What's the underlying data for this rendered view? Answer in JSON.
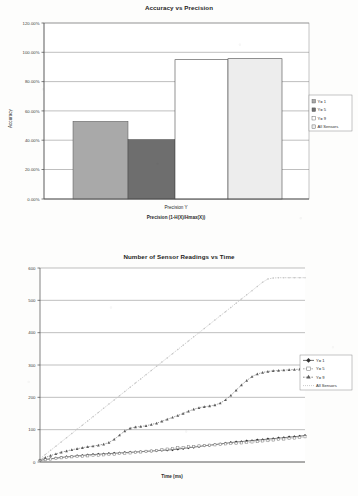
{
  "page": {
    "background": "#fdfdfc",
    "ink": "#2b2b2b"
  },
  "chart_data": [
    {
      "id": "accuracy-vs-precision",
      "type": "bar",
      "title": "Accuracy vs Precision",
      "xlabel": "Precision (1-H(X)/Hmax(X))",
      "x_tick_label": "Precision Y",
      "ylabel": "Accuracy",
      "ylim": [
        0,
        1.2
      ],
      "ytick_labels": [
        "0.00%",
        "20.00%",
        "40.00%",
        "60.00%",
        "80.00%",
        "100.00%",
        "120.00%"
      ],
      "ytick_values": [
        0,
        0.2,
        0.4,
        0.6,
        0.8,
        1.0,
        1.2
      ],
      "grid": true,
      "legend_position": "right",
      "categories": [
        "Y= 1",
        "Y= 5",
        "Y= 9",
        "All Sensors"
      ],
      "values": [
        0.53,
        0.405,
        0.95,
        0.957
      ],
      "value_labels": [
        "53.00%",
        "40.50%",
        "95.00%",
        "95.70%"
      ],
      "bar_colors": [
        "#a9a9a9",
        "#6e6e6e",
        "#ffffff",
        "#ededed"
      ],
      "series": [
        {
          "name": "Y= 1",
          "value": 0.53,
          "color": "#a9a9a9"
        },
        {
          "name": "Y= 5",
          "value": 0.405,
          "color": "#6e6e6e"
        },
        {
          "name": "Y= 9",
          "value": 0.95,
          "color": "#ffffff"
        },
        {
          "name": "All Sensors",
          "value": 0.957,
          "color": "#ededed"
        }
      ]
    },
    {
      "id": "sensor-readings-vs-time",
      "type": "line",
      "title": "Number of Sensor Readings vs Time",
      "xlabel": "Time (ms)",
      "ylabel": "",
      "ylim": [
        0,
        600
      ],
      "ytick_labels": [
        "0",
        "100",
        "200",
        "300",
        "400",
        "500",
        "600"
      ],
      "ytick_values": [
        0,
        100,
        200,
        300,
        400,
        500,
        600
      ],
      "grid": true,
      "legend_position": "right",
      "x": [
        0,
        2,
        4,
        6,
        8,
        10,
        12,
        14,
        16,
        18,
        20,
        22,
        24,
        26,
        28,
        30,
        32,
        34,
        36,
        38,
        40,
        42,
        44,
        46,
        48,
        50,
        52,
        54,
        56,
        58,
        60,
        62,
        64,
        66,
        68,
        70,
        72,
        74,
        76,
        78,
        80,
        82,
        84,
        86,
        88,
        90,
        92,
        94,
        96,
        98,
        100
      ],
      "series": [
        {
          "name": "Y= 1",
          "color": "#303030",
          "marker": "diamond",
          "values": [
            5,
            8,
            10,
            12,
            14,
            16,
            17,
            19,
            20,
            22,
            23,
            24,
            25,
            26,
            27,
            28,
            29,
            30,
            31,
            32,
            33,
            34,
            35,
            36,
            37,
            38,
            40,
            42,
            44,
            46,
            48,
            50,
            52,
            54,
            56,
            58,
            60,
            62,
            63,
            65,
            66,
            68,
            69,
            71,
            72,
            74,
            75,
            77,
            78,
            80,
            82
          ]
        },
        {
          "name": "Y= 5",
          "color": "#8a8a8a",
          "marker": "square",
          "values": [
            5,
            7,
            9,
            11,
            13,
            14,
            16,
            17,
            18,
            19,
            20,
            21,
            22,
            23,
            24,
            26,
            27,
            28,
            30,
            31,
            33,
            34,
            36,
            38,
            40,
            42,
            44,
            45,
            47,
            48,
            50,
            51,
            52,
            53,
            55,
            56,
            57,
            58,
            59,
            60,
            62,
            63,
            65,
            66,
            68,
            70,
            71,
            73,
            74,
            76,
            78
          ]
        },
        {
          "name": "Y= 9",
          "color": "#5c5c5c",
          "marker": "triangle",
          "values": [
            8,
            14,
            20,
            25,
            30,
            34,
            38,
            41,
            44,
            47,
            49,
            52,
            55,
            60,
            70,
            83,
            96,
            104,
            108,
            110,
            112,
            116,
            120,
            126,
            132,
            138,
            144,
            150,
            157,
            163,
            168,
            171,
            173,
            176,
            182,
            192,
            206,
            222,
            238,
            252,
            264,
            272,
            277,
            280,
            282,
            283,
            284,
            285,
            286,
            287,
            288
          ]
        },
        {
          "name": "All Sensors",
          "color": "#c4c4c4",
          "marker": "dot",
          "values": [
            10,
            23,
            36,
            49,
            62,
            75,
            88,
            101,
            114,
            127,
            140,
            153,
            166,
            179,
            192,
            205,
            218,
            231,
            244,
            257,
            270,
            283,
            296,
            309,
            322,
            335,
            348,
            361,
            374,
            387,
            400,
            413,
            426,
            439,
            452,
            465,
            478,
            491,
            504,
            517,
            530,
            543,
            556,
            566,
            569,
            570,
            570,
            570,
            570,
            570,
            570
          ]
        }
      ]
    }
  ]
}
